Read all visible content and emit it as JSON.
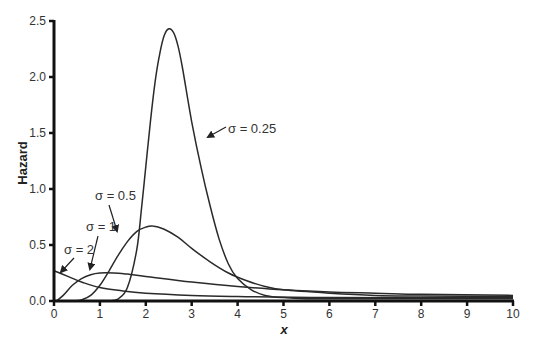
{
  "chart_data": {
    "type": "line",
    "title": "",
    "xlabel": "x",
    "ylabel": "Hazard",
    "xlim": [
      0,
      10
    ],
    "ylim": [
      0,
      2.5
    ],
    "grid": false,
    "legend": "none (inline annotations with arrows)",
    "x_ticks": [
      "0",
      "1",
      "2",
      "3",
      "4",
      "5",
      "6",
      "7",
      "8",
      "9",
      "10"
    ],
    "y_ticks": [
      "0.0",
      "0.5",
      "1.0",
      "1.5",
      "2.0",
      "2.5"
    ],
    "series": [
      {
        "name": "σ = 0.25",
        "points": [
          [
            1.2,
            0
          ],
          [
            1.4,
            0.02
          ],
          [
            1.6,
            0.12
          ],
          [
            1.8,
            0.45
          ],
          [
            1.9,
            0.8
          ],
          [
            2.0,
            1.2
          ],
          [
            2.1,
            1.6
          ],
          [
            2.2,
            1.95
          ],
          [
            2.3,
            2.2
          ],
          [
            2.4,
            2.37
          ],
          [
            2.5,
            2.43
          ],
          [
            2.6,
            2.4
          ],
          [
            2.7,
            2.28
          ],
          [
            2.8,
            2.08
          ],
          [
            3.0,
            1.6
          ],
          [
            3.2,
            1.2
          ],
          [
            3.4,
            0.85
          ],
          [
            3.6,
            0.55
          ],
          [
            3.8,
            0.33
          ],
          [
            4.0,
            0.2
          ],
          [
            4.3,
            0.1
          ],
          [
            4.6,
            0.05
          ],
          [
            5.0,
            0.03
          ],
          [
            5.5,
            0.02
          ],
          [
            6,
            0.02
          ],
          [
            10,
            0.02
          ]
        ]
      },
      {
        "name": "σ = 0.5",
        "points": [
          [
            0.45,
            0
          ],
          [
            0.6,
            0.01
          ],
          [
            0.8,
            0.05
          ],
          [
            1.0,
            0.14
          ],
          [
            1.2,
            0.27
          ],
          [
            1.4,
            0.41
          ],
          [
            1.6,
            0.53
          ],
          [
            1.8,
            0.62
          ],
          [
            2.0,
            0.66
          ],
          [
            2.15,
            0.67
          ],
          [
            2.4,
            0.64
          ],
          [
            2.7,
            0.57
          ],
          [
            3.0,
            0.47
          ],
          [
            3.4,
            0.35
          ],
          [
            3.8,
            0.25
          ],
          [
            4.2,
            0.18
          ],
          [
            4.6,
            0.13
          ],
          [
            5,
            0.1
          ],
          [
            6,
            0.07
          ],
          [
            7,
            0.05
          ],
          [
            8,
            0.045
          ],
          [
            10,
            0.04
          ]
        ]
      },
      {
        "name": "σ = 1",
        "points": [
          [
            0.05,
            0
          ],
          [
            0.2,
            0.05
          ],
          [
            0.4,
            0.14
          ],
          [
            0.6,
            0.2
          ],
          [
            0.8,
            0.235
          ],
          [
            1.0,
            0.25
          ],
          [
            1.3,
            0.25
          ],
          [
            1.6,
            0.24
          ],
          [
            2,
            0.22
          ],
          [
            3,
            0.17
          ],
          [
            4,
            0.13
          ],
          [
            5,
            0.1
          ],
          [
            6,
            0.08
          ],
          [
            7,
            0.07
          ],
          [
            8,
            0.06
          ],
          [
            10,
            0.05
          ]
        ]
      },
      {
        "name": "σ = 2",
        "points": [
          [
            0,
            0.27
          ],
          [
            0.3,
            0.22
          ],
          [
            0.6,
            0.17
          ],
          [
            1,
            0.12
          ],
          [
            1.5,
            0.09
          ],
          [
            2,
            0.07
          ],
          [
            3,
            0.05
          ],
          [
            4,
            0.04
          ],
          [
            6,
            0.03
          ],
          [
            10,
            0.03
          ]
        ]
      }
    ],
    "annotations": [
      {
        "text": "σ = 0.25",
        "label_at": [
          228,
          133
        ],
        "arrow_from": [
          226,
          127
        ],
        "arrow_to": [
          208,
          137
        ]
      },
      {
        "text": "σ = 0.5",
        "label_at": [
          95,
          200
        ],
        "arrow_from": [
          109,
          205
        ],
        "arrow_to": [
          117,
          231
        ]
      },
      {
        "text": "σ = 1",
        "label_at": [
          86,
          231
        ],
        "arrow_from": [
          98,
          236
        ],
        "arrow_to": [
          90,
          269
        ]
      },
      {
        "text": "σ = 2",
        "label_at": [
          64,
          254
        ],
        "arrow_from": [
          74,
          258
        ],
        "arrow_to": [
          61,
          272
        ]
      }
    ]
  },
  "labels": {
    "ylabel": "Hazard",
    "xlabel": "x",
    "sigma_025": "σ = 0.25",
    "sigma_05": "σ = 0.5",
    "sigma_1": "σ = 1",
    "sigma_2": "σ = 2"
  }
}
